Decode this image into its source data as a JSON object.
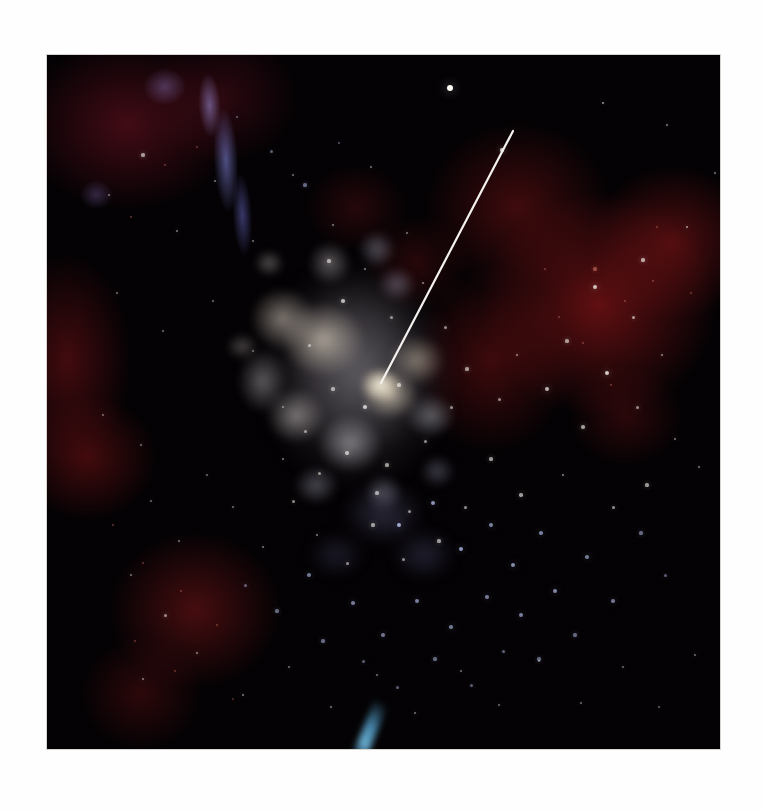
{
  "page": {
    "background_color": "#ffffff",
    "caption": ""
  },
  "plate": {
    "name": "astronomical-image-plate",
    "alt_text": "Color astronomical image of a bright starburst star cluster embedded in red emission nebulosity, with a white pointer line indicating the cluster core",
    "left": 47,
    "top": 55,
    "width": 673,
    "height": 694,
    "background_color": "#030103",
    "border_color": "#d8d4d0"
  },
  "colors": {
    "sky_black": "#030103",
    "nebula_red": "#7a1214",
    "nebula_deep_red": "#4a0c12",
    "nebula_violet": "#8c8ceb",
    "core_cream": "#e2d6c4",
    "core_white": "#fff8e4",
    "star_blue_white": "#cfd8ff",
    "streak_cyan": "#5fb9eb",
    "pointer_white": "#f4f2ee"
  },
  "pointer": {
    "name": "pointer-line",
    "label": "",
    "color": "#f4f2ee",
    "stroke_width": 2.2,
    "x1_page": 513,
    "y1_page": 131,
    "x2_page": 381,
    "y2_page": 383,
    "x1_plate": 466,
    "y1_plate": 76,
    "x2_plate": 334,
    "y2_plate": 328
  },
  "features": [
    {
      "name": "starburst-core",
      "description": "bright cream and blue-white star cluster",
      "cx_plate": 310,
      "cy_plate": 320
    },
    {
      "name": "red-emission-nebula-east",
      "description": "deep red H-alpha nebulosity right of center",
      "cx_plate": 552,
      "cy_plate": 250
    },
    {
      "name": "red-emission-nebula-west",
      "description": "dark red nebulosity along the left edge",
      "cx_plate": 40,
      "cy_plate": 310
    },
    {
      "name": "red-emission-nebula-southwest",
      "description": "red nebular clump lower left",
      "cx_plate": 148,
      "cy_plate": 555
    },
    {
      "name": "violet-filament",
      "description": "blue violet filament in the upper left",
      "cx_plate": 192,
      "cy_plate": 97
    },
    {
      "name": "cyan-streak",
      "description": "small cyan streak near the bottom edge",
      "cx_plate": 323,
      "cy_plate": 675
    },
    {
      "name": "bright-field-star",
      "description": "bright white field star upper center",
      "cx_plate": 403,
      "cy_plate": 33
    }
  ],
  "stars": {
    "white": [
      [
        403,
        33,
        3.4,
        1.0
      ],
      [
        455,
        95,
        1.6,
        0.75
      ],
      [
        556,
        48,
        1.4,
        0.6
      ],
      [
        620,
        70,
        1.2,
        0.5
      ],
      [
        640,
        172,
        1.4,
        0.6
      ],
      [
        668,
        118,
        1.1,
        0.45
      ],
      [
        596,
        205,
        1.6,
        0.65
      ],
      [
        548,
        232,
        1.9,
        0.75
      ],
      [
        586,
        262,
        1.5,
        0.6
      ],
      [
        615,
        300,
        1.4,
        0.55
      ],
      [
        560,
        318,
        2.1,
        0.8
      ],
      [
        520,
        286,
        1.6,
        0.6
      ],
      [
        500,
        334,
        1.9,
        0.7
      ],
      [
        470,
        300,
        1.4,
        0.55
      ],
      [
        536,
        372,
        1.7,
        0.62
      ],
      [
        590,
        352,
        1.5,
        0.55
      ],
      [
        628,
        384,
        1.3,
        0.5
      ],
      [
        652,
        412,
        1.3,
        0.5
      ],
      [
        600,
        430,
        1.6,
        0.6
      ],
      [
        566,
        452,
        1.5,
        0.58
      ],
      [
        516,
        420,
        1.4,
        0.55
      ],
      [
        474,
        440,
        1.7,
        0.62
      ],
      [
        444,
        404,
        1.6,
        0.6
      ],
      [
        418,
        452,
        1.5,
        0.58
      ],
      [
        392,
        486,
        1.6,
        0.6
      ],
      [
        356,
        504,
        1.5,
        0.55
      ],
      [
        326,
        470,
        1.6,
        0.6
      ],
      [
        300,
        508,
        1.5,
        0.55
      ],
      [
        270,
        480,
        1.4,
        0.52
      ],
      [
        246,
        446,
        1.5,
        0.55
      ],
      [
        216,
        492,
        1.3,
        0.5
      ],
      [
        186,
        452,
        1.3,
        0.48
      ],
      [
        160,
        420,
        1.2,
        0.45
      ],
      [
        132,
        486,
        1.3,
        0.48
      ],
      [
        104,
        446,
        1.2,
        0.44
      ],
      [
        84,
        520,
        1.3,
        0.48
      ],
      [
        118,
        560,
        1.5,
        0.55
      ],
      [
        150,
        598,
        1.4,
        0.52
      ],
      [
        96,
        624,
        1.3,
        0.5
      ],
      [
        196,
        640,
        1.4,
        0.52
      ],
      [
        242,
        612,
        1.3,
        0.48
      ],
      [
        284,
        652,
        1.4,
        0.5
      ],
      [
        330,
        620,
        1.3,
        0.48
      ],
      [
        368,
        658,
        1.3,
        0.48
      ],
      [
        414,
        616,
        1.3,
        0.48
      ],
      [
        452,
        650,
        1.2,
        0.45
      ],
      [
        492,
        606,
        1.3,
        0.48
      ],
      [
        534,
        648,
        1.2,
        0.45
      ],
      [
        576,
        612,
        1.2,
        0.44
      ],
      [
        612,
        652,
        1.1,
        0.4
      ],
      [
        648,
        600,
        1.2,
        0.44
      ],
      [
        62,
        140,
        1.3,
        0.48
      ],
      [
        96,
        100,
        1.6,
        0.6
      ],
      [
        130,
        176,
        1.4,
        0.5
      ],
      [
        168,
        126,
        1.4,
        0.5
      ],
      [
        206,
        186,
        1.3,
        0.48
      ],
      [
        246,
        120,
        1.3,
        0.48
      ],
      [
        286,
        170,
        1.4,
        0.5
      ],
      [
        324,
        112,
        1.3,
        0.48
      ],
      [
        360,
        178,
        1.3,
        0.48
      ],
      [
        70,
        238,
        1.3,
        0.46
      ],
      [
        116,
        276,
        1.2,
        0.44
      ],
      [
        166,
        246,
        1.2,
        0.44
      ],
      [
        206,
        296,
        1.2,
        0.44
      ],
      [
        56,
        360,
        1.2,
        0.44
      ],
      [
        94,
        390,
        1.2,
        0.44
      ],
      [
        236,
        352,
        1.4,
        0.5
      ],
      [
        262,
        290,
        1.5,
        0.55
      ],
      [
        296,
        246,
        1.8,
        0.7
      ],
      [
        282,
        206,
        1.6,
        0.6
      ],
      [
        318,
        214,
        1.4,
        0.52
      ],
      [
        344,
        262,
        1.5,
        0.55
      ],
      [
        376,
        228,
        1.4,
        0.52
      ],
      [
        398,
        272,
        1.5,
        0.55
      ],
      [
        420,
        314,
        1.6,
        0.6
      ],
      [
        452,
        344,
        1.5,
        0.55
      ],
      [
        318,
        352,
        1.8,
        0.72
      ],
      [
        352,
        330,
        1.6,
        0.62
      ],
      [
        286,
        334,
        1.6,
        0.6
      ],
      [
        258,
        376,
        1.5,
        0.55
      ],
      [
        300,
        398,
        1.7,
        0.65
      ],
      [
        340,
        410,
        1.6,
        0.6
      ],
      [
        378,
        386,
        1.5,
        0.56
      ],
      [
        404,
        352,
        1.5,
        0.55
      ],
      [
        272,
        418,
        1.5,
        0.55
      ],
      [
        236,
        404,
        1.4,
        0.52
      ],
      [
        330,
        438,
        1.6,
        0.6
      ],
      [
        362,
        456,
        1.5,
        0.55
      ]
    ],
    "blue": [
      [
        352,
        470,
        2.4,
        0.8
      ],
      [
        386,
        448,
        2.0,
        0.7
      ],
      [
        414,
        494,
        2.2,
        0.72
      ],
      [
        444,
        470,
        1.9,
        0.62
      ],
      [
        466,
        510,
        2.1,
        0.68
      ],
      [
        494,
        478,
        1.8,
        0.6
      ],
      [
        508,
        536,
        2.0,
        0.65
      ],
      [
        474,
        560,
        1.9,
        0.6
      ],
      [
        440,
        542,
        1.8,
        0.58
      ],
      [
        404,
        572,
        1.8,
        0.58
      ],
      [
        370,
        546,
        1.9,
        0.6
      ],
      [
        336,
        580,
        1.7,
        0.55
      ],
      [
        306,
        548,
        1.8,
        0.58
      ],
      [
        276,
        586,
        1.6,
        0.5
      ],
      [
        540,
        502,
        1.8,
        0.58
      ],
      [
        566,
        546,
        1.7,
        0.55
      ],
      [
        528,
        580,
        1.6,
        0.5
      ],
      [
        492,
        604,
        1.6,
        0.5
      ],
      [
        456,
        596,
        1.5,
        0.48
      ],
      [
        424,
        630,
        1.5,
        0.46
      ],
      [
        388,
        604,
        1.6,
        0.5
      ],
      [
        350,
        632,
        1.5,
        0.46
      ],
      [
        316,
        606,
        1.5,
        0.46
      ],
      [
        262,
        520,
        1.8,
        0.56
      ],
      [
        230,
        556,
        1.6,
        0.5
      ],
      [
        198,
        530,
        1.5,
        0.46
      ],
      [
        594,
        478,
        1.6,
        0.5
      ],
      [
        618,
        520,
        1.5,
        0.46
      ],
      [
        258,
        130,
        1.6,
        0.5
      ],
      [
        224,
        96,
        1.5,
        0.46
      ],
      [
        190,
        62,
        1.4,
        0.44
      ],
      [
        292,
        88,
        1.4,
        0.44
      ]
    ],
    "red": [
      [
        548,
        214,
        1.6,
        0.55
      ],
      [
        578,
        246,
        1.4,
        0.46
      ],
      [
        512,
        262,
        1.3,
        0.42
      ],
      [
        606,
        226,
        1.3,
        0.42
      ],
      [
        536,
        288,
        1.4,
        0.46
      ],
      [
        498,
        214,
        1.3,
        0.42
      ],
      [
        564,
        330,
        1.3,
        0.42
      ],
      [
        66,
        470,
        1.3,
        0.42
      ],
      [
        96,
        508,
        1.2,
        0.4
      ],
      [
        134,
        536,
        1.3,
        0.42
      ],
      [
        170,
        570,
        1.2,
        0.4
      ],
      [
        88,
        586,
        1.2,
        0.4
      ],
      [
        128,
        616,
        1.2,
        0.4
      ],
      [
        186,
        644,
        1.1,
        0.36
      ],
      [
        118,
        110,
        1.2,
        0.4
      ],
      [
        84,
        162,
        1.2,
        0.4
      ],
      [
        150,
        92,
        1.2,
        0.4
      ],
      [
        644,
        238,
        1.2,
        0.4
      ],
      [
        610,
        172,
        1.2,
        0.4
      ]
    ]
  }
}
